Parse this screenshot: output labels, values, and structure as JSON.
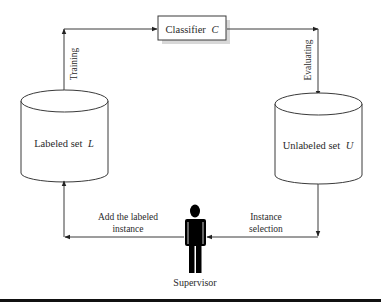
{
  "diagram": {
    "type": "active-learning-cycle",
    "classifier": {
      "label": "Classifier",
      "symbol": "C"
    },
    "labeled_set": {
      "label": "Labeled set",
      "symbol": "L"
    },
    "unlabeled_set": {
      "label": "Unlabeled set",
      "symbol": "U"
    },
    "supervisor": {
      "label": "Supervisor",
      "icon": "person-icon"
    },
    "edges": {
      "training": "Training",
      "evaluating": "Evaluating",
      "instance_selection_line1": "Instance",
      "instance_selection_line2": "selection",
      "add_labeled_line1": "Add the labeled",
      "add_labeled_line2": "instance"
    },
    "colors": {
      "stroke": "#3a3a3a",
      "text": "#2a2a2a",
      "figure": "#000000",
      "rule": "#111111"
    }
  }
}
